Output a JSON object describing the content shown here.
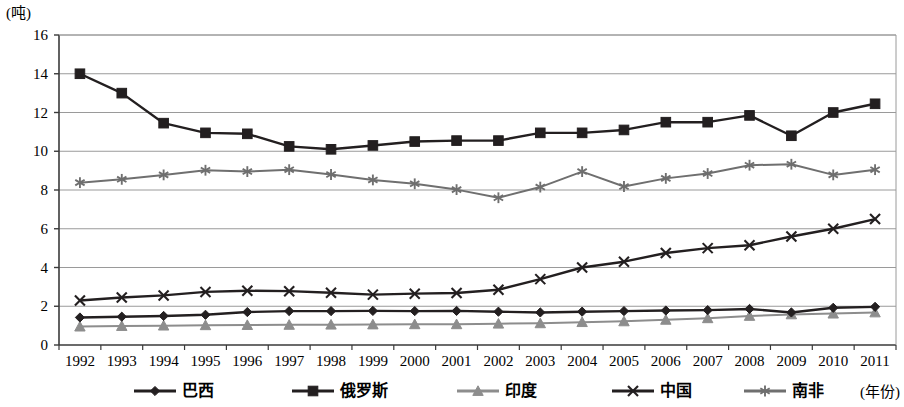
{
  "chart_data": {
    "type": "line",
    "title": "",
    "subtitle": "",
    "xlabel": "(年份)",
    "ylabel": "(吨)",
    "x": [
      1992,
      1993,
      1994,
      1995,
      1996,
      1997,
      1998,
      1999,
      2000,
      2001,
      2002,
      2003,
      2004,
      2005,
      2006,
      2007,
      2008,
      2009,
      2010,
      2011
    ],
    "categories": [
      "1992",
      "1993",
      "1994",
      "1995",
      "1996",
      "1997",
      "1998",
      "1999",
      "2000",
      "2001",
      "2002",
      "2003",
      "2004",
      "2005",
      "2006",
      "2007",
      "2008",
      "2009",
      "2010",
      "2011"
    ],
    "ylim": [
      0,
      16
    ],
    "ytick_step": 2,
    "yticks": [
      "0",
      "2",
      "4",
      "6",
      "8",
      "10",
      "12",
      "14",
      "16"
    ],
    "grid": true,
    "grid_axis": "y",
    "legend_position": "bottom",
    "series": [
      {
        "name": "巴西",
        "marker": "diamond",
        "color": "#231f20",
        "values": [
          1.42,
          1.46,
          1.5,
          1.56,
          1.7,
          1.75,
          1.75,
          1.76,
          1.75,
          1.76,
          1.72,
          1.68,
          1.72,
          1.75,
          1.78,
          1.8,
          1.86,
          1.68,
          1.92,
          1.97
        ]
      },
      {
        "name": "俄罗斯",
        "marker": "square",
        "color": "#231f20",
        "values": [
          14.0,
          13.0,
          11.45,
          10.95,
          10.9,
          10.25,
          10.1,
          10.3,
          10.5,
          10.55,
          10.55,
          10.95,
          10.95,
          11.1,
          11.5,
          11.5,
          11.85,
          10.8,
          12.0,
          12.45
        ]
      },
      {
        "name": "印度",
        "marker": "triangle",
        "color": "#8d8d8d",
        "values": [
          0.95,
          0.98,
          1.0,
          1.02,
          1.03,
          1.04,
          1.05,
          1.06,
          1.07,
          1.07,
          1.1,
          1.12,
          1.18,
          1.22,
          1.3,
          1.38,
          1.5,
          1.58,
          1.62,
          1.68
        ]
      },
      {
        "name": "中国",
        "marker": "x",
        "color": "#231f20",
        "values": [
          2.3,
          2.45,
          2.56,
          2.74,
          2.8,
          2.78,
          2.7,
          2.6,
          2.65,
          2.68,
          2.85,
          3.4,
          4.0,
          4.3,
          4.75,
          5.0,
          5.15,
          5.6,
          6.0,
          6.5
        ]
      },
      {
        "name": "南非",
        "marker": "star",
        "color": "#6f6f6f",
        "values": [
          8.38,
          8.55,
          8.78,
          9.02,
          8.95,
          9.05,
          8.8,
          8.52,
          8.32,
          8.02,
          7.6,
          8.15,
          8.95,
          8.18,
          8.6,
          8.85,
          9.28,
          9.33,
          8.78,
          9.05
        ]
      }
    ]
  },
  "legend": {
    "items": [
      {
        "label": "巴西"
      },
      {
        "label": "俄罗斯"
      },
      {
        "label": "印度"
      },
      {
        "label": "中国"
      },
      {
        "label": "南非"
      }
    ]
  },
  "axes": {
    "y_unit_label": "(吨)",
    "x_unit_label": "(年份)"
  },
  "colors": {
    "line_dark": "#231f20",
    "line_gray": "#8d8d8d",
    "line_midgray": "#6f6f6f",
    "grid": "#9a9a9a",
    "axis": "#3a3a3a",
    "background": "#ffffff"
  }
}
